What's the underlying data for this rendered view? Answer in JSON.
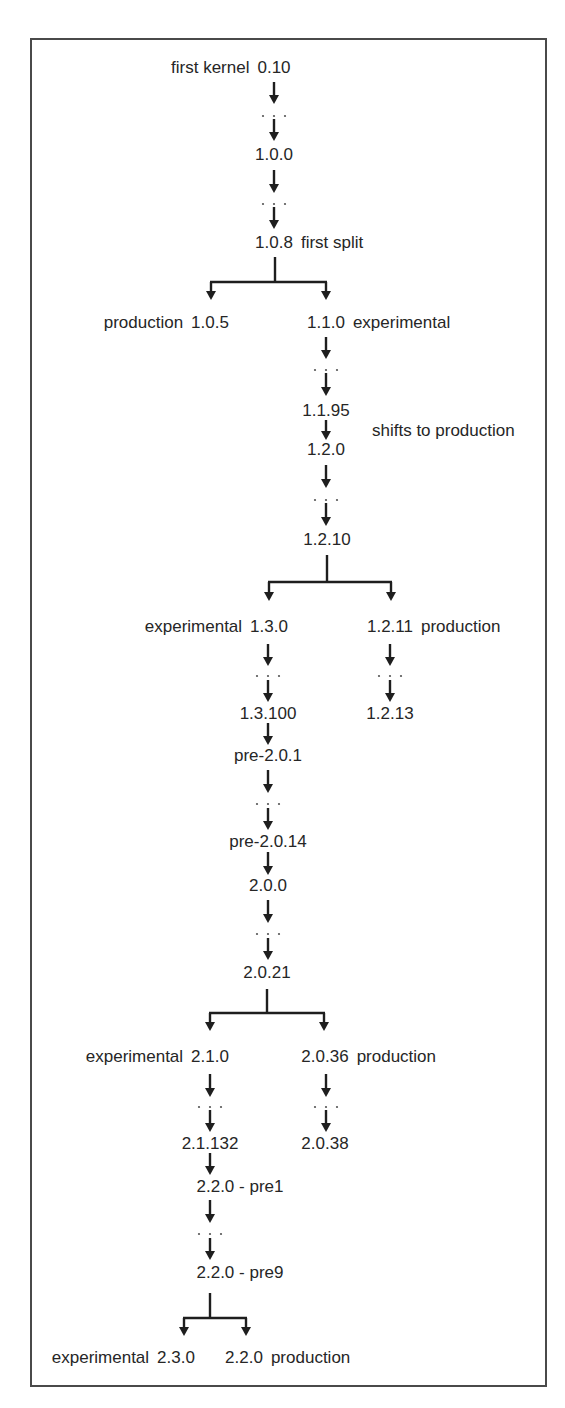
{
  "diagram": {
    "colors": {
      "line": "#1e1e1e",
      "text": "#262626",
      "frame": "#4a4a4a"
    },
    "nodes": [
      {
        "id": "n0_10",
        "version": "0.10",
        "note": "first kernel",
        "note_side": "left",
        "x": 274,
        "y": 68
      },
      {
        "id": "n1_0_0",
        "version": "1.0.0",
        "note": "",
        "note_side": "",
        "x": 274,
        "y": 155
      },
      {
        "id": "n1_0_8",
        "version": "1.0.8",
        "note": "first split",
        "note_side": "right",
        "x": 274,
        "y": 243
      },
      {
        "id": "n1_0_5",
        "version": "1.0.5",
        "note": "production",
        "note_side": "left",
        "x": 210,
        "y": 323
      },
      {
        "id": "n1_1_0",
        "version": "1.1.0",
        "note": "experimental",
        "note_side": "right",
        "x": 326,
        "y": 323
      },
      {
        "id": "n1_1_95",
        "version": "1.1.95",
        "note": "",
        "note_side": "",
        "x": 326,
        "y": 411
      },
      {
        "id": "n1_2_0",
        "version": "1.2.0",
        "note": "",
        "note_side": "",
        "x": 326,
        "y": 450
      },
      {
        "id": "n1_2_10",
        "version": "1.2.10",
        "note": "",
        "note_side": "",
        "x": 327,
        "y": 540
      },
      {
        "id": "n1_3_0",
        "version": "1.3.0",
        "note": "experimental",
        "note_side": "left",
        "x": 269,
        "y": 627
      },
      {
        "id": "n1_2_11",
        "version": "1.2.11",
        "note": "production",
        "note_side": "right",
        "x": 390,
        "y": 627
      },
      {
        "id": "n1_3_100",
        "version": "1.3.100",
        "note": "",
        "note_side": "",
        "x": 268,
        "y": 714
      },
      {
        "id": "n1_2_13",
        "version": "1.2.13",
        "note": "",
        "note_side": "",
        "x": 390,
        "y": 714
      },
      {
        "id": "npre201",
        "version": "pre-2.0.1",
        "note": "",
        "note_side": "",
        "x": 268,
        "y": 756
      },
      {
        "id": "npre2014",
        "version": "pre-2.0.14",
        "note": "",
        "note_side": "",
        "x": 268,
        "y": 842
      },
      {
        "id": "n2_0_0",
        "version": "2.0.0",
        "note": "",
        "note_side": "",
        "x": 268,
        "y": 886
      },
      {
        "id": "n2_0_21",
        "version": "2.0.21",
        "note": "",
        "note_side": "",
        "x": 267,
        "y": 973
      },
      {
        "id": "n2_1_0",
        "version": "2.1.0",
        "note": "experimental",
        "note_side": "left",
        "x": 210,
        "y": 1057
      },
      {
        "id": "n2_0_36",
        "version": "2.0.36",
        "note": "production",
        "note_side": "right",
        "x": 325,
        "y": 1057
      },
      {
        "id": "n2_1_132",
        "version": "2.1.132",
        "note": "",
        "note_side": "",
        "x": 210,
        "y": 1144
      },
      {
        "id": "n2_0_38",
        "version": "2.0.38",
        "note": "",
        "note_side": "",
        "x": 325,
        "y": 1144
      },
      {
        "id": "npre1",
        "version": "2.2.0 - pre1",
        "note": "",
        "note_side": "",
        "x": 240,
        "y": 1187
      },
      {
        "id": "npre9",
        "version": "2.2.0 - pre9",
        "note": "",
        "note_side": "",
        "x": 240,
        "y": 1273
      },
      {
        "id": "n2_3_0",
        "version": "2.3.0",
        "note": "experimental",
        "note_side": "left",
        "x": 176,
        "y": 1358
      },
      {
        "id": "n2_2_0",
        "version": "2.2.0",
        "note": "production",
        "note_side": "right",
        "x": 244,
        "y": 1358
      }
    ],
    "annotations": [
      {
        "id": "shift",
        "text": "shifts to production",
        "x": 372,
        "y": 431
      }
    ],
    "arrows": [
      {
        "x": 274,
        "y1": 82,
        "y2": 104
      },
      {
        "x": 274,
        "y1": 119,
        "y2": 141
      },
      {
        "x": 274,
        "y1": 170,
        "y2": 193
      },
      {
        "x": 274,
        "y1": 207,
        "y2": 229
      },
      {
        "x": 326,
        "y1": 337,
        "y2": 359
      },
      {
        "x": 326,
        "y1": 373,
        "y2": 396
      },
      {
        "x": 326,
        "y1": 420,
        "y2": 440
      },
      {
        "x": 326,
        "y1": 465,
        "y2": 488
      },
      {
        "x": 326,
        "y1": 503,
        "y2": 526
      },
      {
        "x": 268,
        "y1": 644,
        "y2": 666
      },
      {
        "x": 268,
        "y1": 680,
        "y2": 702
      },
      {
        "x": 268,
        "y1": 723,
        "y2": 745
      },
      {
        "x": 268,
        "y1": 770,
        "y2": 793
      },
      {
        "x": 268,
        "y1": 808,
        "y2": 830
      },
      {
        "x": 268,
        "y1": 852,
        "y2": 875
      },
      {
        "x": 268,
        "y1": 900,
        "y2": 923
      },
      {
        "x": 268,
        "y1": 938,
        "y2": 960
      },
      {
        "x": 390,
        "y1": 644,
        "y2": 666
      },
      {
        "x": 390,
        "y1": 680,
        "y2": 702
      },
      {
        "x": 210,
        "y1": 1074,
        "y2": 1097
      },
      {
        "x": 210,
        "y1": 1110,
        "y2": 1132
      },
      {
        "x": 210,
        "y1": 1153,
        "y2": 1175
      },
      {
        "x": 210,
        "y1": 1200,
        "y2": 1223
      },
      {
        "x": 210,
        "y1": 1238,
        "y2": 1260
      },
      {
        "x": 326,
        "y1": 1074,
        "y2": 1097
      },
      {
        "x": 326,
        "y1": 1110,
        "y2": 1132
      }
    ],
    "ellipses": [
      {
        "x": 274,
        "y": 116
      },
      {
        "x": 274,
        "y": 204
      },
      {
        "x": 326,
        "y": 370
      },
      {
        "x": 326,
        "y": 500
      },
      {
        "x": 268,
        "y": 676
      },
      {
        "x": 390,
        "y": 676
      },
      {
        "x": 268,
        "y": 804
      },
      {
        "x": 268,
        "y": 934
      },
      {
        "x": 210,
        "y": 1107
      },
      {
        "x": 326,
        "y": 1107
      },
      {
        "x": 210,
        "y": 1234
      }
    ],
    "splits": [
      {
        "stem_x": 275,
        "y_top": 257,
        "y_bar": 282,
        "left_x": 211,
        "right_x": 326,
        "y_tip": 300
      },
      {
        "stem_x": 327,
        "y_top": 555,
        "y_bar": 582,
        "left_x": 269,
        "right_x": 391,
        "y_tip": 601
      },
      {
        "stem_x": 267,
        "y_top": 989,
        "y_bar": 1013,
        "left_x": 210,
        "right_x": 324,
        "y_tip": 1031
      },
      {
        "stem_x": 210,
        "y_top": 1293,
        "y_bar": 1318,
        "left_x": 184,
        "right_x": 246,
        "y_tip": 1336
      }
    ]
  }
}
